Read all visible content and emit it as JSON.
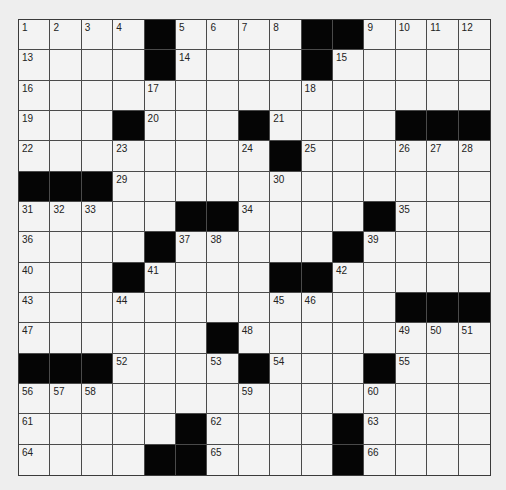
{
  "puzzle": {
    "rows": 15,
    "cols": 15,
    "grid": [
      [
        "1",
        "2",
        "3",
        "4",
        "#",
        "5",
        "6",
        "7",
        "8",
        "#",
        "#",
        "9",
        "10",
        "11",
        "12"
      ],
      [
        "13",
        "",
        "",
        "",
        "#",
        "14",
        "",
        "",
        "",
        "#",
        "15",
        "",
        "",
        "",
        ""
      ],
      [
        "16",
        "",
        "",
        "",
        "17",
        "",
        "",
        "",
        "",
        "18",
        "",
        "",
        "",
        "",
        ""
      ],
      [
        "19",
        "",
        "",
        "#",
        "20",
        "",
        "",
        "#",
        "21",
        "",
        "",
        "",
        "#",
        "#",
        "#"
      ],
      [
        "22",
        "",
        "",
        "23",
        "",
        "",
        "",
        "24",
        "#",
        "25",
        "",
        "",
        "26",
        "27",
        "28"
      ],
      [
        "#",
        "#",
        "#",
        "29",
        "",
        "",
        "",
        "",
        "30",
        "",
        "",
        "",
        "",
        "",
        ""
      ],
      [
        "31",
        "32",
        "33",
        "",
        "",
        "#",
        "#",
        "34",
        "",
        "",
        "",
        "#",
        "35",
        "",
        ""
      ],
      [
        "36",
        "",
        "",
        "",
        "#",
        "37",
        "38",
        "",
        "",
        "",
        "#",
        "39",
        "",
        "",
        ""
      ],
      [
        "40",
        "",
        "",
        "#",
        "41",
        "",
        "",
        "",
        "#",
        "#",
        "42",
        "",
        "",
        "",
        ""
      ],
      [
        "43",
        "",
        "",
        "44",
        "",
        "",
        "",
        "",
        "45",
        "46",
        "",
        "",
        "#",
        "#",
        "#"
      ],
      [
        "47",
        "",
        "",
        "",
        "",
        "",
        "#",
        "48",
        "",
        "",
        "",
        "",
        "49",
        "50",
        "51"
      ],
      [
        "#",
        "#",
        "#",
        "52",
        "",
        "",
        "53",
        "#",
        "54",
        "",
        "",
        "#",
        "55",
        "",
        ""
      ],
      [
        "56",
        "57",
        "58",
        "",
        "",
        "",
        "",
        "59",
        "",
        "",
        "",
        "60",
        "",
        "",
        ""
      ],
      [
        "61",
        "",
        "",
        "",
        "",
        "#",
        "62",
        "",
        "",
        "",
        "#",
        "63",
        "",
        "",
        ""
      ],
      [
        "64",
        "",
        "",
        "",
        "#",
        "#",
        "65",
        "",
        "",
        "",
        "#",
        "66",
        "",
        "",
        ""
      ]
    ],
    "colors": {
      "background": "#eeeeee",
      "cell": "#f3f3f3",
      "block": "#050505",
      "line": "#4a4a4a",
      "number": "#222222"
    }
  }
}
